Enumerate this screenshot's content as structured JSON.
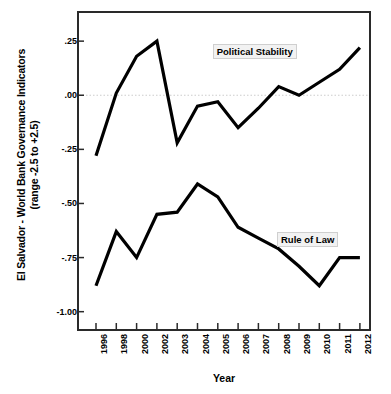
{
  "chart_data": {
    "type": "line",
    "title": "",
    "xlabel": "Year",
    "ylabel": "El Salvador - World Bank Governance Indicators (range -2.5 to +2.5)",
    "ylabel_line1": "El Salvador - World Bank Governance Indicators",
    "ylabel_line2": "(range -2.5 to +2.5)",
    "categories": [
      "1996",
      "1998",
      "2000",
      "2002",
      "2003",
      "2004",
      "2005",
      "2006",
      "2007",
      "2008",
      "2009",
      "2010",
      "2011",
      "2012"
    ],
    "x_tick_labels": [
      "1996",
      "1998",
      "2000",
      "2002",
      "2003",
      "2004",
      "2005",
      "2006",
      "2007",
      "2008",
      "2009",
      "2010",
      "2011",
      "2012"
    ],
    "y_tick_labels": [
      ".25",
      ".00",
      "-.25",
      "-.50",
      "-.75",
      "-1.00"
    ],
    "y_tick_values": [
      0.25,
      0.0,
      -0.25,
      -0.5,
      -0.75,
      -1.0
    ],
    "ylim": [
      -1.08,
      0.38
    ],
    "grid": "zero-line-only",
    "zero_line": 0.0,
    "legend_position": "inline-annotations",
    "series": [
      {
        "name": "Political Stability",
        "color": "#000000",
        "values": [
          -0.28,
          0.01,
          0.18,
          0.25,
          -0.22,
          -0.05,
          -0.03,
          -0.15,
          -0.06,
          0.04,
          0.0,
          0.06,
          0.12,
          0.22
        ],
        "label_x_category": "2008",
        "label_y_value": 0.21
      },
      {
        "name": "Rule of Law",
        "color": "#000000",
        "values": [
          -0.88,
          -0.63,
          -0.75,
          -0.55,
          -0.54,
          -0.41,
          -0.47,
          -0.61,
          -0.66,
          -0.71,
          -0.79,
          -0.88,
          -0.75,
          -0.75
        ],
        "label_x_category": "2009",
        "label_y_value": -0.66
      }
    ]
  },
  "figure": {
    "background_color": "#ffffff",
    "axis_color": "#2a2a2a",
    "line_color": "#000000",
    "zero_line_color": "#cccccc"
  }
}
